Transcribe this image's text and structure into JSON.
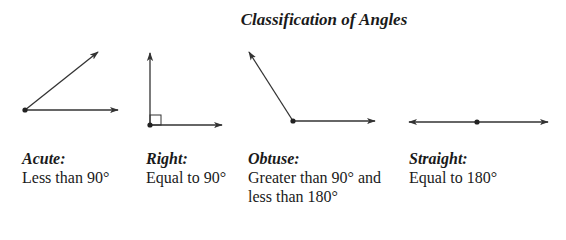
{
  "title": "Classification of Angles",
  "colors": {
    "stroke": "#333333",
    "text": "#1a1a1a",
    "background": "#ffffff"
  },
  "angles": [
    {
      "name": "Acute:",
      "description": "Less than 90°"
    },
    {
      "name": "Right:",
      "description": "Equal to 90°"
    },
    {
      "name": "Obtuse:",
      "description_line1": "Greater than 90° and",
      "description_line2": "less than 180°"
    },
    {
      "name": "Straight:",
      "description": "Equal to 180°"
    }
  ]
}
